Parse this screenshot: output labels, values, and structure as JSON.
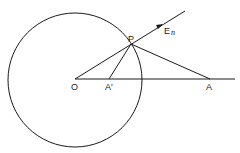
{
  "diagram": {
    "labels": {
      "O": "O",
      "A_prime": "A′",
      "A": "A",
      "P": "P",
      "E": "E",
      "E_sub": "n"
    },
    "points": {
      "O": [
        75,
        79
      ],
      "A_prime": [
        109,
        79
      ],
      "A": [
        210,
        79
      ],
      "P": [
        131,
        44
      ]
    },
    "circle": {
      "center": [
        75,
        79
      ],
      "radius": 67
    },
    "colors": {
      "ink": "#1a1a1a",
      "background": "#ffffff"
    }
  }
}
